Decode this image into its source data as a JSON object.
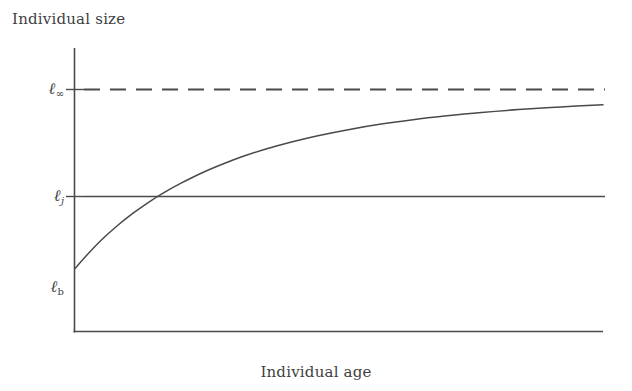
{
  "figure": {
    "background_color": "#ffffff",
    "ink_color": "#3f3f3f"
  },
  "axes": {
    "y_title": "Individual size",
    "x_title": "Individual age",
    "y_tick_labels": [
      {
        "symbol": "ℓ",
        "subscript": "∞",
        "name": "l-infinity",
        "y_value": 1.0
      },
      {
        "symbol": "ℓ",
        "subscript": "j",
        "name": "l-juvenile",
        "y_value": 0.62
      },
      {
        "symbol": "ℓ",
        "subscript": "b",
        "name": "l-birth",
        "y_value": 0.26
      }
    ]
  },
  "chart_data": {
    "type": "line",
    "title": "",
    "xlabel": "Individual age",
    "ylabel": "Individual size",
    "xlim": [
      0,
      1
    ],
    "ylim": [
      0,
      1.12
    ],
    "grid": false,
    "legend": null,
    "annotations": [
      {
        "label": "ℓ∞",
        "type": "asymptote",
        "style": "dashed",
        "y": 1.0
      },
      {
        "label": "ℓj",
        "type": "reference-line",
        "style": "solid",
        "y": 0.62
      },
      {
        "label": "ℓb",
        "type": "start-value",
        "y": 0.26
      }
    ],
    "series": [
      {
        "name": "von Bertalanffy growth curve",
        "style": "solid",
        "x": [
          0.0,
          0.02,
          0.05,
          0.08,
          0.11,
          0.14,
          0.17,
          0.2,
          0.24,
          0.28,
          0.32,
          0.36,
          0.41,
          0.46,
          0.52,
          0.58,
          0.64,
          0.7,
          0.77,
          0.84,
          0.92,
          1.0
        ],
        "y": [
          0.26,
          0.31,
          0.378,
          0.437,
          0.489,
          0.535,
          0.576,
          0.612,
          0.655,
          0.692,
          0.725,
          0.753,
          0.783,
          0.809,
          0.835,
          0.857,
          0.875,
          0.89,
          0.905,
          0.917,
          0.928,
          0.937
        ]
      },
      {
        "name": "asymptotic size line",
        "style": "dashed",
        "x": [
          0.0,
          1.0
        ],
        "y": [
          1.0,
          1.0
        ]
      },
      {
        "name": "juvenile size line",
        "style": "solid",
        "x": [
          0.0,
          1.0
        ],
        "y": [
          0.62,
          0.62
        ]
      }
    ]
  }
}
